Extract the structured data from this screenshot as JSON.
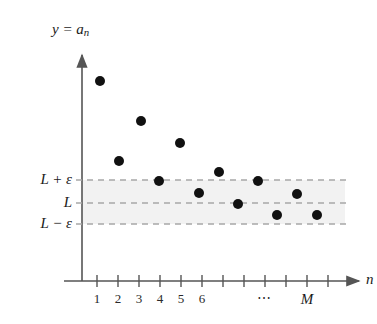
{
  "figure": {
    "background_color": "#ffffff",
    "ink_color": "#1a1a1a"
  },
  "axes": {
    "y_axis_label": "y = a",
    "y_axis_label_sub": "n",
    "x_axis_label": "n",
    "axis_color": "#555555",
    "origin_px": {
      "x": 82,
      "y": 281
    },
    "y_axis_top_px": 55,
    "x_axis_right_px": 345
  },
  "band": {
    "upper_label": "L + ε",
    "center_label": "L",
    "lower_label": "L − ε",
    "fill_color": "#f2f2f2",
    "line_color": "#a8a8a8",
    "line_style": "dashed",
    "upper_y_px": 180,
    "center_y_px": 203,
    "lower_y_px": 224,
    "left_x_px": 82,
    "right_x_px": 345
  },
  "x_ticks": {
    "count": 12,
    "first_x_px": 97,
    "spacing_px": 21,
    "labels": [
      "1",
      "2",
      "3",
      "4",
      "5",
      "6"
    ],
    "ellipsis": "⋯",
    "ellipsis_tick_index": 8,
    "M_label": "M",
    "M_tick_index": 10
  },
  "chart_data": {
    "type": "scatter",
    "title": "",
    "xlabel": "n",
    "ylabel": "y = a_n",
    "grid": false,
    "legend": null,
    "marker": {
      "shape": "circle",
      "color": "#111111",
      "radius_px": 5
    },
    "annotations": [
      {
        "text": "L + ε",
        "kind": "y-gridline-label",
        "y_px": 180
      },
      {
        "text": "L",
        "kind": "y-gridline-label",
        "y_px": 203
      },
      {
        "text": "L − ε",
        "kind": "y-gridline-label",
        "y_px": 224
      },
      {
        "text": "⋯",
        "kind": "x-axis-ellipsis"
      },
      {
        "text": "M",
        "kind": "x-axis-threshold"
      }
    ],
    "x": [
      1,
      2,
      3,
      4,
      5,
      6,
      7,
      8,
      9,
      10,
      11,
      12
    ],
    "points_px": [
      {
        "n": 1,
        "x": 100,
        "y": 81
      },
      {
        "n": 2,
        "x": 119,
        "y": 161
      },
      {
        "n": 3,
        "x": 141,
        "y": 121
      },
      {
        "n": 4,
        "x": 159,
        "y": 181
      },
      {
        "n": 5,
        "x": 180,
        "y": 143
      },
      {
        "n": 6,
        "x": 199,
        "y": 193
      },
      {
        "n": 7,
        "x": 219,
        "y": 172
      },
      {
        "n": 8,
        "x": 238,
        "y": 204
      },
      {
        "n": 9,
        "x": 258,
        "y": 181
      },
      {
        "n": 10,
        "x": 277,
        "y": 215
      },
      {
        "n": 11,
        "x": 297,
        "y": 194
      },
      {
        "n": 12,
        "x": 317,
        "y": 215
      }
    ]
  }
}
